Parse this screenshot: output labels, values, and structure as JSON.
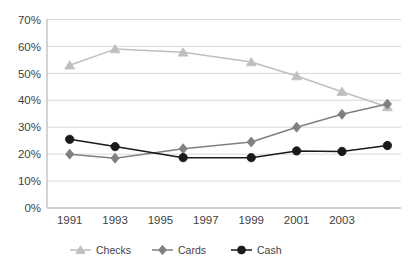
{
  "chart_data": {
    "type": "line",
    "title": "",
    "subtitle": "",
    "xlabel": "",
    "ylabel": "",
    "x": [
      1991,
      1993,
      1996,
      1999,
      2001,
      2003,
      2005
    ],
    "xlim": [
      1990,
      2005.6
    ],
    "ylim": [
      0,
      70
    ],
    "ytick_values": [
      0,
      10,
      20,
      30,
      40,
      50,
      60,
      70
    ],
    "ytick_labels": [
      "0%",
      "10%",
      "20%",
      "30%",
      "40%",
      "50%",
      "60%",
      "70%"
    ],
    "xtick_values": [
      1991,
      1993,
      1995,
      1997,
      1999,
      2001,
      2003
    ],
    "xtick_labels": [
      "1991",
      "1993",
      "1995",
      "1997",
      "1999",
      "2001",
      "2003"
    ],
    "grid": true,
    "grid_axis": "y",
    "legend_position": "bottom",
    "series": [
      {
        "name": "Checks",
        "marker": "triangle",
        "color": "#bfbfbf",
        "values": [
          53.0,
          59.0,
          57.8,
          54.2,
          49.0,
          43.2,
          37.5
        ]
      },
      {
        "name": "Cards",
        "marker": "diamond",
        "color": "#808080",
        "values": [
          20.0,
          18.5,
          22.0,
          24.5,
          30.0,
          34.8,
          38.6
        ]
      },
      {
        "name": "Cash",
        "marker": "circle",
        "color": "#1a1a1a",
        "values": [
          25.5,
          22.8,
          18.7,
          18.7,
          21.2,
          21.0,
          23.2
        ]
      }
    ]
  },
  "legend": {
    "items": [
      {
        "label": "Checks",
        "marker": "triangle",
        "color": "#bfbfbf"
      },
      {
        "label": "Cards",
        "marker": "diamond",
        "color": "#808080"
      },
      {
        "label": "Cash",
        "marker": "circle",
        "color": "#1a1a1a"
      }
    ]
  },
  "axes": {
    "y_axis_color": "#c9c9c9",
    "x_axis_color": "#c9c9c9",
    "grid_color": "#d9d9d9",
    "plot_background": "#ffffff"
  }
}
